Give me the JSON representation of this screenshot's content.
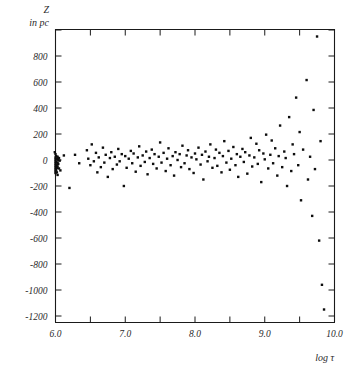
{
  "chart_data": {
    "type": "scatter",
    "title": "",
    "xlabel": "log τ",
    "ylabel_line1": "Z",
    "ylabel_line2": "in pc",
    "xlim": [
      6.0,
      10.0
    ],
    "ylim": [
      -1250,
      1050
    ],
    "grid": false,
    "legend": null,
    "x_ticks": [
      6.0,
      6.5,
      7.0,
      7.5,
      8.0,
      8.5,
      9.0,
      9.5,
      10.0
    ],
    "x_tick_labels": [
      "6.0",
      "",
      "7.0",
      "",
      "8.0",
      "",
      "9.0",
      "",
      "10.0"
    ],
    "y_ticks": [
      1000,
      800,
      600,
      400,
      200,
      0,
      -200,
      -400,
      -600,
      -800,
      -1000,
      -1200
    ],
    "y_tick_labels": [
      "",
      "800",
      "600",
      "400",
      "200",
      "0",
      "-200",
      "-400",
      "-600",
      "-800",
      "-1000",
      "-1200"
    ],
    "marker": "filled-square",
    "marker_size_px": 2.4,
    "marker_color": "#0d0d0d",
    "series": [
      {
        "name": "stars",
        "points": [
          [
            5.98,
            235
          ],
          [
            5.99,
            60
          ],
          [
            6.0,
            45
          ],
          [
            6.0,
            20
          ],
          [
            6.0,
            5
          ],
          [
            6.0,
            -10
          ],
          [
            6.0,
            -25
          ],
          [
            6.0,
            -40
          ],
          [
            6.0,
            -55
          ],
          [
            6.0,
            -70
          ],
          [
            6.0,
            -85
          ],
          [
            6.0,
            -100
          ],
          [
            6.01,
            30
          ],
          [
            6.01,
            -15
          ],
          [
            6.01,
            -45
          ],
          [
            6.01,
            -75
          ],
          [
            6.02,
            10
          ],
          [
            6.02,
            -35
          ],
          [
            6.02,
            -60
          ],
          [
            6.02,
            -95
          ],
          [
            6.03,
            25
          ],
          [
            6.03,
            -20
          ],
          [
            6.03,
            -50
          ],
          [
            6.03,
            -115
          ],
          [
            6.04,
            0
          ],
          [
            6.04,
            -30
          ],
          [
            6.05,
            15
          ],
          [
            6.05,
            -65
          ],
          [
            6.06,
            -5
          ],
          [
            6.07,
            -80
          ],
          [
            6.12,
            35
          ],
          [
            6.2,
            -215
          ],
          [
            6.28,
            40
          ],
          [
            6.34,
            -25
          ],
          [
            6.45,
            75
          ],
          [
            6.47,
            10
          ],
          [
            6.5,
            -40
          ],
          [
            6.52,
            120
          ],
          [
            6.55,
            -10
          ],
          [
            6.58,
            55
          ],
          [
            6.6,
            -95
          ],
          [
            6.62,
            20
          ],
          [
            6.65,
            -55
          ],
          [
            6.68,
            95
          ],
          [
            6.7,
            -20
          ],
          [
            6.72,
            40
          ],
          [
            6.75,
            -130
          ],
          [
            6.78,
            15
          ],
          [
            6.8,
            60
          ],
          [
            6.82,
            -70
          ],
          [
            6.85,
            25
          ],
          [
            6.88,
            -35
          ],
          [
            6.9,
            85
          ],
          [
            6.92,
            -10
          ],
          [
            6.95,
            45
          ],
          [
            6.98,
            -200
          ],
          [
            7.0,
            30
          ],
          [
            7.02,
            -60
          ],
          [
            7.05,
            10
          ],
          [
            7.08,
            70
          ],
          [
            7.1,
            -25
          ],
          [
            7.12,
            50
          ],
          [
            7.15,
            -90
          ],
          [
            7.18,
            20
          ],
          [
            7.2,
            105
          ],
          [
            7.22,
            -45
          ],
          [
            7.25,
            35
          ],
          [
            7.28,
            -15
          ],
          [
            7.3,
            65
          ],
          [
            7.32,
            -110
          ],
          [
            7.35,
            15
          ],
          [
            7.38,
            80
          ],
          [
            7.4,
            -30
          ],
          [
            7.42,
            45
          ],
          [
            7.45,
            -65
          ],
          [
            7.48,
            25
          ],
          [
            7.5,
            135
          ],
          [
            7.52,
            -20
          ],
          [
            7.55,
            55
          ],
          [
            7.58,
            -85
          ],
          [
            7.6,
            10
          ],
          [
            7.62,
            90
          ],
          [
            7.65,
            -40
          ],
          [
            7.68,
            30
          ],
          [
            7.7,
            -120
          ],
          [
            7.72,
            60
          ],
          [
            7.75,
            0
          ],
          [
            7.78,
            45
          ],
          [
            7.8,
            -55
          ],
          [
            7.82,
            110
          ],
          [
            7.85,
            -25
          ],
          [
            7.88,
            35
          ],
          [
            7.9,
            75
          ],
          [
            7.92,
            -70
          ],
          [
            7.95,
            20
          ],
          [
            7.98,
            -100
          ],
          [
            8.0,
            50
          ],
          [
            8.02,
            5
          ],
          [
            8.05,
            95
          ],
          [
            8.08,
            -35
          ],
          [
            8.1,
            40
          ],
          [
            8.12,
            -150
          ],
          [
            8.15,
            65
          ],
          [
            8.18,
            -10
          ],
          [
            8.2,
            25
          ],
          [
            8.22,
            120
          ],
          [
            8.25,
            -60
          ],
          [
            8.28,
            15
          ],
          [
            8.3,
            80
          ],
          [
            8.32,
            -45
          ],
          [
            8.35,
            55
          ],
          [
            8.38,
            -95
          ],
          [
            8.4,
            30
          ],
          [
            8.42,
            145
          ],
          [
            8.45,
            -20
          ],
          [
            8.48,
            70
          ],
          [
            8.5,
            -75
          ],
          [
            8.52,
            10
          ],
          [
            8.55,
            100
          ],
          [
            8.58,
            -40
          ],
          [
            8.6,
            45
          ],
          [
            8.62,
            -130
          ],
          [
            8.65,
            25
          ],
          [
            8.68,
            85
          ],
          [
            8.7,
            -15
          ],
          [
            8.72,
            60
          ],
          [
            8.75,
            -105
          ],
          [
            8.78,
            35
          ],
          [
            8.8,
            170
          ],
          [
            8.82,
            -50
          ],
          [
            8.85,
            20
          ],
          [
            8.88,
            125
          ],
          [
            8.9,
            -30
          ],
          [
            8.92,
            75
          ],
          [
            8.95,
            -170
          ],
          [
            8.98,
            50
          ],
          [
            9.0,
            5
          ],
          [
            9.02,
            195
          ],
          [
            9.05,
            -65
          ],
          [
            9.08,
            40
          ],
          [
            9.1,
            150
          ],
          [
            9.12,
            -25
          ],
          [
            9.15,
            90
          ],
          [
            9.18,
            -120
          ],
          [
            9.2,
            30
          ],
          [
            9.22,
            265
          ],
          [
            9.25,
            -55
          ],
          [
            9.28,
            65
          ],
          [
            9.3,
            15
          ],
          [
            9.32,
            -200
          ],
          [
            9.35,
            330
          ],
          [
            9.38,
            -85
          ],
          [
            9.4,
            120
          ],
          [
            9.42,
            45
          ],
          [
            9.45,
            480
          ],
          [
            9.48,
            -40
          ],
          [
            9.5,
            215
          ],
          [
            9.52,
            -310
          ],
          [
            9.55,
            80
          ],
          [
            9.6,
            615
          ],
          [
            9.62,
            -150
          ],
          [
            9.65,
            25
          ],
          [
            9.68,
            -430
          ],
          [
            9.7,
            385
          ],
          [
            9.72,
            -70
          ],
          [
            9.75,
            950
          ],
          [
            9.78,
            -620
          ],
          [
            9.8,
            145
          ],
          [
            9.82,
            -960
          ],
          [
            9.85,
            -1150
          ]
        ]
      }
    ]
  },
  "figure": {
    "frame_color": "#1a1a1a",
    "background": "#ffffff"
  }
}
